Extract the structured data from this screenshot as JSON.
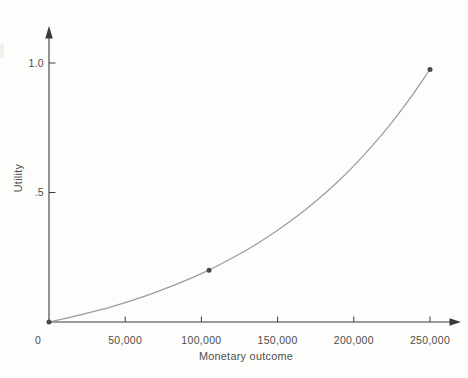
{
  "figure": {
    "background": "#fdfdfb"
  },
  "chart_data": {
    "type": "line",
    "title": "",
    "xlabel": "Monetary outcome",
    "ylabel": "Utility",
    "xlim": [
      0,
      262000
    ],
    "ylim": [
      0,
      1.14
    ],
    "grid": false,
    "legend": null,
    "x_axis_max_value": 250000,
    "y_axis_max_value": 1.0,
    "x_ticks": [
      {
        "value": 0,
        "label": "0"
      },
      {
        "value": 50000,
        "label": "50,000"
      },
      {
        "value": 100000,
        "label": "100,000"
      },
      {
        "value": 150000,
        "label": "150,000"
      },
      {
        "value": 200000,
        "label": "200,000"
      },
      {
        "value": 250000,
        "label": "250,000"
      }
    ],
    "y_ticks": [
      {
        "value": 0.5,
        "label": ".5"
      },
      {
        "value": 1.0,
        "label": "1.0"
      }
    ],
    "series": [
      {
        "name": "utility-curve",
        "x": [
          0,
          12500,
          25000,
          37500,
          50000,
          62500,
          75000,
          87500,
          100000,
          112500,
          125000,
          137500,
          150000,
          162500,
          175000,
          187500,
          200000,
          212500,
          225000,
          237500,
          250000
        ],
        "y": [
          0,
          0.016,
          0.034,
          0.053,
          0.075,
          0.099,
          0.126,
          0.155,
          0.187,
          0.223,
          0.262,
          0.306,
          0.354,
          0.407,
          0.466,
          0.531,
          0.603,
          0.683,
          0.771,
          0.868,
          0.975
        ]
      }
    ],
    "marked_points": [
      {
        "x": 0,
        "y": 0
      },
      {
        "x": 105000,
        "y": 0.2
      },
      {
        "x": 250000,
        "y": 0.975
      }
    ],
    "colors": {
      "curve": "#9b9b9b",
      "axis": "#3a3a3a",
      "text": "#4d4d4d",
      "point": "#4a4a4a"
    }
  }
}
